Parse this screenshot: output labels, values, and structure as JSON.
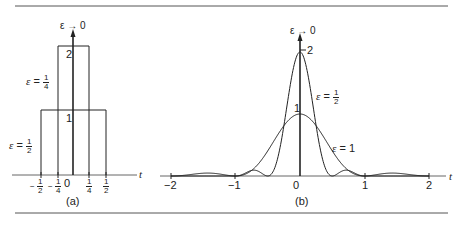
{
  "figure": {
    "panel_a": {
      "caption": "(a)",
      "axis_label": "t",
      "arrow_label": "ε → 0",
      "tick_labels": [
        "−1/2",
        "−1/4",
        "0",
        "1/4",
        "1/2"
      ],
      "height_labels": [
        "1",
        "2"
      ],
      "curve_labels": [
        {
          "text": "ε = 1/4",
          "eps_num": "1",
          "eps_den": "4"
        },
        {
          "text": "ε = 1/2",
          "eps_num": "1",
          "eps_den": "2"
        }
      ]
    },
    "panel_b": {
      "caption": "(b)",
      "axis_label": "t",
      "arrow_label": "ε → 0",
      "tick_labels": [
        "−2",
        "−1",
        "0",
        "1",
        "2"
      ],
      "height_labels": [
        "1",
        "2"
      ],
      "curve_labels": [
        {
          "text": "ε = 1/2",
          "eps_num": "1",
          "eps_den": "2"
        },
        {
          "text": "ε = 1"
        }
      ]
    }
  },
  "chart_data": [
    {
      "type": "line",
      "title": "(a) rectangular pulses approaching impulse",
      "xlabel": "t",
      "ylabel": "",
      "series": [
        {
          "name": "ε = 1/2",
          "x": [
            -0.5,
            -0.5,
            0.5,
            0.5
          ],
          "values": [
            0,
            1,
            1,
            0
          ]
        },
        {
          "name": "ε = 1/4",
          "x": [
            -0.25,
            -0.25,
            0.25,
            0.25
          ],
          "values": [
            0,
            2,
            2,
            0
          ]
        }
      ],
      "annotations": [
        "ε → 0 (impulse arrow at t=0)"
      ],
      "xlim": [
        -0.75,
        0.75
      ],
      "ylim": [
        0,
        2.3
      ],
      "grid": false
    },
    {
      "type": "line",
      "title": "(b) sinc-squared pulses approaching impulse",
      "xlabel": "t",
      "ylabel": "",
      "series": [
        {
          "name": "ε = 1",
          "x": [
            -2,
            -1.5,
            -1,
            -0.5,
            0,
            0.5,
            1,
            1.5,
            2
          ],
          "values": [
            0,
            0.045,
            0,
            0.405,
            1,
            0.405,
            0,
            0.045,
            0
          ]
        },
        {
          "name": "ε = 1/2",
          "x": [
            -1,
            -0.75,
            -0.5,
            -0.25,
            0,
            0.25,
            0.5,
            0.75,
            1
          ],
          "values": [
            0,
            0.09,
            0,
            0.81,
            2,
            0.81,
            0,
            0.09,
            0
          ]
        }
      ],
      "annotations": [
        "ε → 0 (impulse arrow at t=0)"
      ],
      "xlim": [
        -2,
        2
      ],
      "ylim": [
        0,
        2.3
      ],
      "grid": false
    }
  ]
}
